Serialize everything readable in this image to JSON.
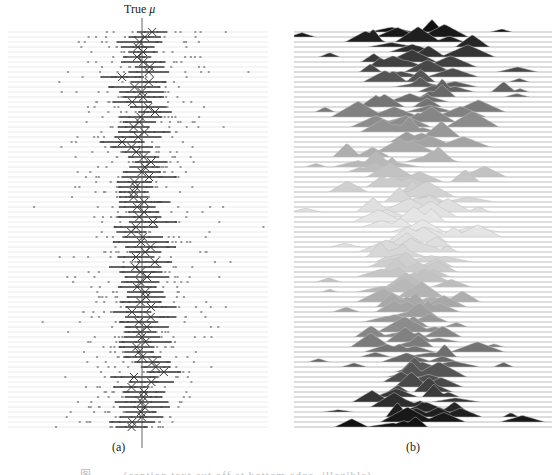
{
  "figure": {
    "true_mu_label": "True",
    "true_mu_symbol": "μ",
    "panel_a_label": "(a)",
    "panel_b_label": "(b)",
    "caption": "图 …… (caption text cut off at bottom edge, illegible)"
  },
  "colors": {
    "gridline": "#e6e6e6",
    "dot": "#9a9a9a",
    "errorbar": "#333333",
    "marker": "#333333",
    "true_mu_line": "#555555",
    "ridge_dark": "#111111",
    "ridge_light": "#e8e8e8",
    "ridge_outline": "#bdbdbd"
  },
  "chart_data": [
    {
      "panel": "a",
      "type": "scatter",
      "title": "",
      "annotation": "True μ",
      "xlabel": "",
      "ylabel": "",
      "grid": "horizontal row lines",
      "true_mu_x_px": 142,
      "rows": 80,
      "row_top_px": 32,
      "row_spacing_px": 5,
      "x_extent_px": [
        8,
        268
      ],
      "description": "Each row: ~10 gray sample dots, a dark horizontal error bar (interval), and an X marker at the sample mean; means scatter around the vertical True μ line.",
      "seed": 7
    },
    {
      "panel": "b",
      "type": "area",
      "title": "",
      "xlabel": "",
      "ylabel": "",
      "grid": "horizontal baseline per row",
      "rows": 80,
      "row_top_px": 32,
      "row_spacing_px": 5,
      "x_extent_px": [
        294,
        552
      ],
      "center_x_px": 418,
      "description": "Ridgeline (joy) plot of per-row density estimates; fill shading goes dark at top and bottom rows, light in the middle rows.",
      "seed": 11
    }
  ]
}
